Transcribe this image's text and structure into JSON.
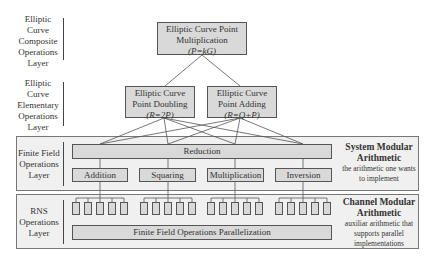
{
  "layers": [
    {
      "name": "composite",
      "label": "Elliptic Curve Composite Operations Layer",
      "lines": [
        "Elliptic",
        "Curve",
        "Composite",
        "Operations",
        "Layer"
      ]
    },
    {
      "name": "elementary",
      "label": "Elliptic Curve Elementary Operations Layer",
      "lines": [
        "Elliptic",
        "Curve",
        "Elementary",
        "Operations",
        "Layer"
      ]
    },
    {
      "name": "finite-field",
      "label": "Finite Field Operations Layer",
      "lines": [
        "Finite Field",
        "Operations",
        "Layer"
      ]
    },
    {
      "name": "rns",
      "label": "RNS Operations Layer",
      "lines": [
        "RNS",
        "Operations",
        "Layer"
      ]
    }
  ],
  "composite": {
    "line1": "Elliptic Curve Point",
    "line2": "Multiplication",
    "formula": "(P=kG)"
  },
  "doubling": {
    "line1": "Elliptic Curve",
    "line2": "Point Doubling",
    "formula": "(R=2P)"
  },
  "adding": {
    "line1": "Elliptic Curve",
    "line2": "Point Adding",
    "formula": "(R=Q+P)"
  },
  "finite_field": {
    "reduction": "Reduction",
    "ops": [
      "Addition",
      "Squaring",
      "Multiplication",
      "Inversion"
    ]
  },
  "rns": {
    "channels_per_group": 5,
    "groups": 4,
    "parallelization": "Finite Field Operations Parallelization"
  },
  "system_modular": {
    "title_line1": "System Modular",
    "title_line2": "Arithmetic",
    "desc_line1": "the arithmetic one wants",
    "desc_line2": "to implement"
  },
  "channel_modular": {
    "title_line1": "Channel Modular",
    "title_line2": "Arithmetic",
    "desc_line1": "auxiliar arithmetic that",
    "desc_line2": "supports parallel",
    "desc_line3": "implementations"
  },
  "colors": {
    "box_fill": "#d9d9d9",
    "band_fill": "#f0f0f0",
    "stroke": "#555555"
  }
}
